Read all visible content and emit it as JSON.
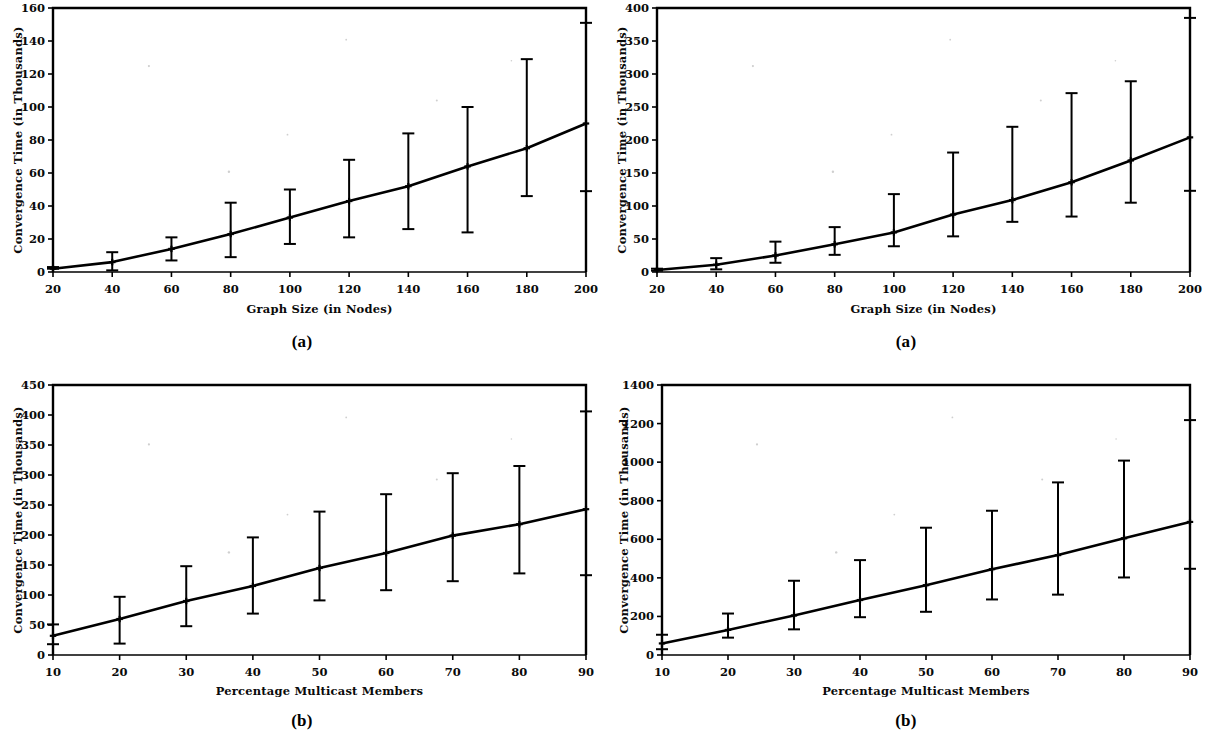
{
  "figure": {
    "background": "#ffffff",
    "ink": "#000000",
    "panels": [
      "a",
      "b",
      "a",
      "b"
    ]
  },
  "captions": {
    "top_left": "(a)",
    "top_right": "(a)",
    "bottom_left": "(b)",
    "bottom_right": "(b)"
  },
  "chart_data": [
    {
      "id": "top-left",
      "panel_label": "(a)",
      "type": "line",
      "title": "",
      "xlabel": "Graph Size (in Nodes)",
      "ylabel": "Convergence Time (in Thousands)",
      "xlim": [
        20,
        200
      ],
      "ylim": [
        0,
        160
      ],
      "xticks": [
        20,
        40,
        60,
        80,
        100,
        120,
        140,
        160,
        180,
        200
      ],
      "xticklabels": [
        "20",
        "40",
        "60",
        "80",
        "100",
        "120",
        "140",
        "160",
        "180",
        "200"
      ],
      "yticks": [
        0,
        20,
        40,
        60,
        80,
        100,
        120,
        140,
        160
      ],
      "yticklabels": [
        "0",
        "20",
        "40",
        "60",
        "80",
        "100",
        "120",
        "140",
        "160"
      ],
      "grid": false,
      "legend": null,
      "series": [
        {
          "name": "Convergence Time",
          "x": [
            20,
            40,
            60,
            80,
            100,
            120,
            140,
            160,
            180,
            200
          ],
          "values": [
            2,
            6,
            14,
            23,
            33,
            43,
            52,
            64,
            75,
            90
          ],
          "err_low": [
            2,
            1,
            7,
            9,
            17,
            21,
            26,
            24,
            46,
            49
          ],
          "err_high": [
            3,
            12,
            21,
            42,
            50,
            68,
            84,
            100,
            129,
            151
          ],
          "marker": "cross"
        }
      ]
    },
    {
      "id": "top-right",
      "panel_label": "(a)",
      "type": "line",
      "title": "",
      "xlabel": "Graph Size (in Nodes)",
      "ylabel": "Convergence Time (in Thousands)",
      "xlim": [
        20,
        200
      ],
      "ylim": [
        0,
        400
      ],
      "xticks": [
        20,
        40,
        60,
        80,
        100,
        120,
        140,
        160,
        180,
        200
      ],
      "xticklabels": [
        "20",
        "40",
        "60",
        "80",
        "100",
        "120",
        "140",
        "160",
        "180",
        "200"
      ],
      "yticks": [
        0,
        50,
        100,
        150,
        200,
        250,
        300,
        350,
        400
      ],
      "yticklabels": [
        "0",
        "50",
        "100",
        "150",
        "200",
        "250",
        "300",
        "350",
        "400"
      ],
      "grid": false,
      "legend": null,
      "series": [
        {
          "name": "Convergence Time",
          "x": [
            20,
            40,
            60,
            80,
            100,
            120,
            140,
            160,
            180,
            200
          ],
          "values": [
            3,
            11,
            25,
            42,
            60,
            87,
            109,
            136,
            169,
            204
          ],
          "err_low": [
            2,
            4,
            14,
            26,
            39,
            54,
            76,
            84,
            105,
            123
          ],
          "err_high": [
            5,
            21,
            46,
            68,
            118,
            181,
            220,
            271,
            289,
            385
          ],
          "marker": "cross"
        }
      ]
    },
    {
      "id": "bottom-left",
      "panel_label": "(b)",
      "type": "line",
      "title": "",
      "xlabel": "Percentage Multicast Members",
      "ylabel": "Convergence Time (in Thousands)",
      "xlim": [
        10,
        90
      ],
      "ylim": [
        0,
        450
      ],
      "xticks": [
        10,
        20,
        30,
        40,
        50,
        60,
        70,
        80,
        90
      ],
      "xticklabels": [
        "10",
        "20",
        "30",
        "40",
        "50",
        "60",
        "70",
        "80",
        "90"
      ],
      "yticks": [
        0,
        50,
        100,
        150,
        200,
        250,
        300,
        350,
        400,
        450
      ],
      "yticklabels": [
        "0",
        "50",
        "100",
        "150",
        "200",
        "250",
        "300",
        "350",
        "400",
        "450"
      ],
      "grid": false,
      "legend": null,
      "series": [
        {
          "name": "Convergence Time",
          "x": [
            10,
            20,
            30,
            40,
            50,
            60,
            70,
            80,
            90
          ],
          "values": [
            32,
            60,
            90,
            115,
            145,
            170,
            199,
            218,
            243
          ],
          "err_low": [
            18,
            19,
            48,
            69,
            91,
            108,
            123,
            136,
            133
          ],
          "err_high": [
            51,
            97,
            148,
            196,
            239,
            268,
            303,
            315,
            406
          ],
          "marker": "cross"
        }
      ]
    },
    {
      "id": "bottom-right",
      "panel_label": "(b)",
      "type": "line",
      "title": "",
      "xlabel": "Percentage Multicast Members",
      "ylabel": "Convergence Time (in Thousands)",
      "xlim": [
        10,
        90
      ],
      "ylim": [
        0,
        1400
      ],
      "xticks": [
        10,
        20,
        30,
        40,
        50,
        60,
        70,
        80,
        90
      ],
      "xticklabels": [
        "10",
        "20",
        "30",
        "40",
        "50",
        "60",
        "70",
        "80",
        "90"
      ],
      "yticks": [
        0,
        200,
        400,
        600,
        800,
        1000,
        1200,
        1400
      ],
      "yticklabels": [
        "0",
        "200",
        "400",
        "600",
        "800",
        "1000",
        "1200",
        "1400"
      ],
      "grid": false,
      "legend": null,
      "series": [
        {
          "name": "Convergence Time",
          "x": [
            10,
            20,
            30,
            40,
            50,
            60,
            70,
            80,
            90
          ],
          "values": [
            60,
            130,
            205,
            285,
            362,
            445,
            518,
            605,
            690
          ],
          "err_low": [
            30,
            90,
            133,
            196,
            224,
            288,
            313,
            402,
            447
          ],
          "err_high": [
            105,
            215,
            385,
            492,
            660,
            748,
            895,
            1008,
            1218
          ],
          "marker": "cross"
        }
      ]
    }
  ]
}
